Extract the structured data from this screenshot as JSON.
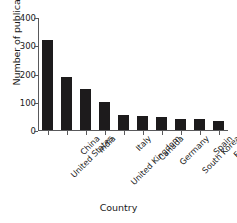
{
  "chart_data": {
    "type": "bar",
    "title": "",
    "xlabel": "Country",
    "ylabel": "Number of publication",
    "categories": [
      "United States",
      "China",
      "India",
      "United Kingdom",
      "Italy",
      "Canada",
      "Germany",
      "South Korea",
      "Spain",
      "France"
    ],
    "values": [
      322,
      188,
      145,
      99,
      53,
      50,
      47,
      38,
      38,
      30
    ],
    "ylim": [
      0,
      400
    ],
    "yticks": [
      0,
      100,
      200,
      300,
      400
    ],
    "ytick_labels": [
      "0",
      "100",
      "200",
      "300",
      "400"
    ],
    "grid": false,
    "legend": null,
    "bar_color": "#1d1b1c",
    "axis_color": "#59595b",
    "background": "#ffffff",
    "xtick_rotation": -45
  }
}
